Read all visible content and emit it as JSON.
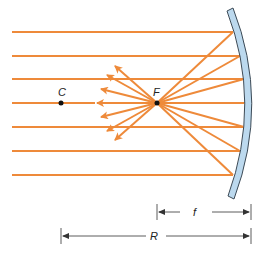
{
  "diagram": {
    "type": "concave-mirror-ray-diagram",
    "colors": {
      "ray": "#ee8a3a",
      "mirror_fill": "#bcd9ee",
      "mirror_stroke": "#3c4a56",
      "point": "#111111",
      "dimension": "#333333"
    },
    "labels": {
      "center_of_curvature": "C",
      "focal_point": "F",
      "focal_length": "f",
      "radius": "R"
    },
    "incoming_rays_y": [
      32,
      56,
      79,
      103,
      127,
      151,
      175
    ],
    "focal_point": {
      "x": 157,
      "y": 103
    },
    "center_point": {
      "x": 61,
      "y": 103
    }
  }
}
